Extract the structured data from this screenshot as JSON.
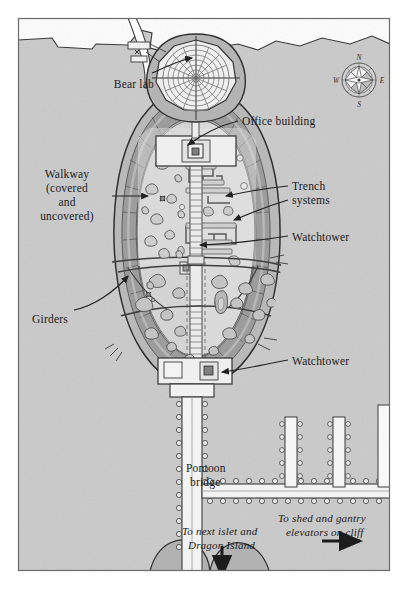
{
  "map": {
    "title": "Island facility plan",
    "orientation": {
      "compass_name": "compass-rose",
      "north": "N",
      "east": "E",
      "south": "S",
      "west": "W"
    },
    "labels": [
      {
        "id": "bear-lab",
        "text": "Bear lab",
        "x": 80,
        "y": 78,
        "w": 74,
        "align": "right",
        "style": "roman",
        "size": 11.5
      },
      {
        "id": "office-building",
        "text": "Office building",
        "x": 242,
        "y": 115,
        "w": 110,
        "align": "left",
        "style": "roman",
        "size": 11.5
      },
      {
        "id": "walkway",
        "text": "Walkway",
        "x": 24,
        "y": 168,
        "w": 86,
        "align": "center",
        "style": "roman",
        "size": 11.5
      },
      {
        "id": "walkway-sub1",
        "text": "(covered",
        "x": 24,
        "y": 182,
        "w": 86,
        "align": "center",
        "style": "roman",
        "size": 11.5
      },
      {
        "id": "walkway-sub2",
        "text": "and",
        "x": 24,
        "y": 196,
        "w": 86,
        "align": "center",
        "style": "roman",
        "size": 11.5
      },
      {
        "id": "walkway-sub3",
        "text": "uncovered)",
        "x": 24,
        "y": 210,
        "w": 86,
        "align": "center",
        "style": "roman",
        "size": 11.5
      },
      {
        "id": "trench-systems",
        "text": "Trench",
        "x": 292,
        "y": 180,
        "w": 80,
        "align": "left",
        "style": "roman",
        "size": 11.5
      },
      {
        "id": "trench-systems2",
        "text": "systems",
        "x": 292,
        "y": 194,
        "w": 80,
        "align": "left",
        "style": "roman",
        "size": 11.5
      },
      {
        "id": "watchtower-top",
        "text": "Watchtower",
        "x": 292,
        "y": 231,
        "w": 92,
        "align": "left",
        "style": "roman",
        "size": 11.5
      },
      {
        "id": "girders",
        "text": "Girders",
        "x": 32,
        "y": 313,
        "w": 66,
        "align": "left",
        "style": "roman",
        "size": 11.5
      },
      {
        "id": "watchtower-bot",
        "text": "Watchtower",
        "x": 292,
        "y": 355,
        "w": 92,
        "align": "left",
        "style": "roman",
        "size": 11.5
      },
      {
        "id": "pontoon-bridge",
        "text": "Pontoon",
        "x": 186,
        "y": 462,
        "w": 78,
        "align": "left",
        "style": "roman",
        "size": 11.5
      },
      {
        "id": "pontoon-bridge2",
        "text": "bridge",
        "x": 190,
        "y": 476,
        "w": 78,
        "align": "left",
        "style": "roman",
        "size": 11.5
      },
      {
        "id": "to-next-islet",
        "text": "To next islet and",
        "x": 182,
        "y": 525,
        "w": 118,
        "align": "left",
        "style": "italic",
        "size": 11
      },
      {
        "id": "to-next-islet2",
        "text": "Dragon Island",
        "x": 188,
        "y": 539,
        "w": 118,
        "align": "left",
        "style": "italic",
        "size": 11
      },
      {
        "id": "to-shed",
        "text": "To shed and gantry",
        "x": 278,
        "y": 512,
        "w": 124,
        "align": "left",
        "style": "italic",
        "size": 11
      },
      {
        "id": "to-shed2",
        "text": "elevators on cliff",
        "x": 286,
        "y": 526,
        "w": 118,
        "align": "left",
        "style": "italic",
        "size": 11
      }
    ],
    "features": {
      "bear_lab": {
        "name": "circular bear laboratory",
        "rings": 7,
        "spokes": 16
      },
      "office_building": {
        "name": "office building block"
      },
      "walkway_ring": {
        "name": "covered and uncovered perimeter walkway",
        "segments": 34
      },
      "trench_systems": {
        "name": "maze trench systems",
        "count": 3
      },
      "watchtowers": {
        "name": "watchtower",
        "count": 2
      },
      "girders": {
        "name": "girder spans",
        "count": 2
      },
      "pontoon_bridge": {
        "name": "pontoon bridge",
        "pontoons_visible": 60
      },
      "piers": {
        "name": "pontoon piers to cliff",
        "count": 3
      },
      "boulders": {
        "name": "scattered boulders",
        "count": 38
      }
    },
    "colors": {
      "water": "#ffffff",
      "land": "#cbcbcb",
      "land_edge": "#3a3a3a",
      "island_fill": "#d6d6d6",
      "island_inner": "#dcdcdc",
      "walkway_dark": "#9a9a9a",
      "walkway_mid": "#b5b5b5",
      "structure_fill": "#efefef",
      "rock_dark": "#a6a6a6",
      "ink": "#2b2b2b",
      "frame": "#555555"
    },
    "arrows": [
      {
        "id": "arrow-bear-lab",
        "from": [
          155,
          75
        ],
        "to": [
          196,
          60
        ]
      },
      {
        "id": "arrow-office",
        "from": [
          236,
          121
        ],
        "to": [
          186,
          146
        ]
      },
      {
        "id": "arrow-walkway",
        "from": [
          112,
          196
        ],
        "to": [
          150,
          196
        ]
      },
      {
        "id": "arrow-trench-1",
        "from": [
          286,
          184
        ],
        "to": [
          219,
          196
        ]
      },
      {
        "id": "arrow-trench-2",
        "from": [
          286,
          196
        ],
        "to": [
          227,
          219
        ]
      },
      {
        "id": "arrow-watch-top",
        "from": [
          286,
          236
        ],
        "to": [
          196,
          243
        ]
      },
      {
        "id": "arrow-girders",
        "from": [
          74,
          310
        ],
        "to": [
          130,
          270
        ]
      },
      {
        "id": "arrow-watch-bot",
        "from": [
          286,
          360
        ],
        "to": [
          214,
          372
        ]
      },
      {
        "id": "arrow-to-islet",
        "from": [
          222,
          545
        ],
        "to": [
          222,
          580
        ]
      },
      {
        "id": "arrow-to-shed",
        "from": [
          322,
          540
        ],
        "to": [
          362,
          540
        ]
      }
    ]
  }
}
